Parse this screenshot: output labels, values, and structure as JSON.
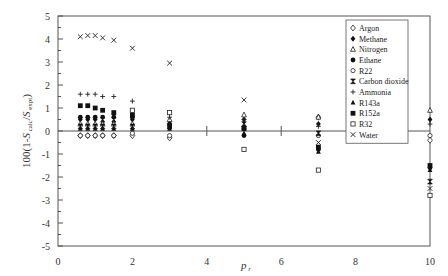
{
  "chart_data": {
    "type": "scatter",
    "title": "",
    "xlabel": "p r",
    "ylabel": "100(1-S calc/S expt)",
    "xlim": [
      0,
      10
    ],
    "ylim": [
      -5,
      5
    ],
    "xticks": [
      0,
      2,
      4,
      6,
      8,
      10
    ],
    "yticks": [
      -5,
      -4,
      -3,
      -2,
      -1,
      0,
      1,
      2,
      3,
      4,
      5
    ],
    "grid": false,
    "legend_position": "upper right (inside)",
    "series": [
      {
        "name": "Argon",
        "marker": "diamond-open",
        "points": [
          [
            0.6,
            -0.2
          ],
          [
            0.8,
            -0.2
          ],
          [
            1.0,
            -0.2
          ],
          [
            1.2,
            -0.2
          ],
          [
            1.5,
            -0.2
          ],
          [
            2.0,
            -0.2
          ],
          [
            3.0,
            -0.3
          ],
          [
            5.0,
            0.2
          ],
          [
            7.0,
            0.6
          ],
          [
            10.0,
            -0.4
          ]
        ]
      },
      {
        "name": "Methane",
        "marker": "diamond-filled",
        "points": [
          [
            0.6,
            0.5
          ],
          [
            0.8,
            0.5
          ],
          [
            1.0,
            0.5
          ],
          [
            1.2,
            0.4
          ],
          [
            1.5,
            0.4
          ],
          [
            2.0,
            0.5
          ],
          [
            3.0,
            0.3
          ],
          [
            5.0,
            0.5
          ],
          [
            7.0,
            0.3
          ],
          [
            10.0,
            0.5
          ]
        ]
      },
      {
        "name": "Nitrogen",
        "marker": "triangle-open",
        "points": [
          [
            0.6,
            0.3
          ],
          [
            0.8,
            0.3
          ],
          [
            1.0,
            0.3
          ],
          [
            1.2,
            0.3
          ],
          [
            1.5,
            0.3
          ],
          [
            2.0,
            0.3
          ],
          [
            3.0,
            0.5
          ],
          [
            5.0,
            0.7
          ],
          [
            7.0,
            0.6
          ],
          [
            10.0,
            0.9
          ]
        ]
      },
      {
        "name": "Ethane",
        "marker": "circle-filled",
        "points": [
          [
            0.6,
            0.6
          ],
          [
            0.8,
            0.6
          ],
          [
            1.0,
            0.6
          ],
          [
            1.2,
            0.6
          ],
          [
            1.5,
            0.6
          ],
          [
            2.0,
            0.6
          ],
          [
            3.0,
            0.3
          ],
          [
            5.0,
            -0.2
          ],
          [
            7.0,
            -0.8
          ],
          [
            10.0,
            -1.6
          ]
        ]
      },
      {
        "name": "R22",
        "marker": "circle-open",
        "points": [
          [
            0.6,
            -0.2
          ],
          [
            0.8,
            -0.2
          ],
          [
            1.0,
            -0.2
          ],
          [
            1.2,
            -0.2
          ],
          [
            1.5,
            -0.2
          ],
          [
            2.0,
            -0.1
          ],
          [
            3.0,
            -0.2
          ],
          [
            5.0,
            0.1
          ],
          [
            7.0,
            -0.2
          ],
          [
            10.0,
            -0.2
          ]
        ]
      },
      {
        "name": "Carbon dioxide",
        "marker": "hourglass",
        "points": [
          [
            0.6,
            0.2
          ],
          [
            0.8,
            0.2
          ],
          [
            1.0,
            0.2
          ],
          [
            1.2,
            0.2
          ],
          [
            1.5,
            0.2
          ],
          [
            2.0,
            0.2
          ],
          [
            3.0,
            0.2
          ],
          [
            5.0,
            0.3
          ],
          [
            7.0,
            -0.1
          ],
          [
            10.0,
            -2.2
          ]
        ]
      },
      {
        "name": "Ammonia",
        "marker": "plus",
        "points": [
          [
            0.6,
            1.6
          ],
          [
            0.8,
            1.6
          ],
          [
            1.0,
            1.6
          ],
          [
            1.2,
            1.5
          ],
          [
            1.5,
            1.5
          ],
          [
            2.0,
            1.3
          ],
          [
            3.0,
            0.6
          ],
          [
            5.0,
            0.5
          ],
          [
            7.0,
            0.2
          ],
          [
            10.0,
            0.3
          ]
        ]
      },
      {
        "name": "R143a",
        "marker": "triangle-filled",
        "points": [
          [
            0.6,
            0.1
          ],
          [
            0.8,
            0.1
          ],
          [
            1.0,
            0.1
          ],
          [
            1.2,
            0.1
          ],
          [
            1.5,
            0.1
          ],
          [
            2.0,
            0.1
          ],
          [
            3.0,
            0.1
          ],
          [
            5.0,
            -0.1
          ],
          [
            7.0,
            -0.9
          ],
          [
            10.0,
            -1.7
          ]
        ]
      },
      {
        "name": "R152a",
        "marker": "square-filled",
        "points": [
          [
            0.6,
            1.1
          ],
          [
            0.8,
            1.1
          ],
          [
            1.0,
            1.0
          ],
          [
            1.2,
            0.9
          ],
          [
            1.5,
            0.8
          ],
          [
            2.0,
            0.7
          ],
          [
            3.0,
            0.2
          ],
          [
            5.0,
            0.1
          ],
          [
            7.0,
            -0.7
          ],
          [
            10.0,
            -1.5
          ]
        ]
      },
      {
        "name": "R32",
        "marker": "square-open",
        "points": [
          [
            2.0,
            0.9
          ],
          [
            3.0,
            0.8
          ],
          [
            5.0,
            -0.8
          ],
          [
            7.0,
            -1.7
          ],
          [
            10.0,
            -2.8
          ]
        ]
      },
      {
        "name": "Water",
        "marker": "x",
        "points": [
          [
            0.6,
            4.1
          ],
          [
            0.8,
            4.15
          ],
          [
            1.0,
            4.15
          ],
          [
            1.2,
            4.05
          ],
          [
            1.5,
            3.95
          ],
          [
            2.0,
            3.6
          ],
          [
            3.0,
            2.95
          ],
          [
            5.0,
            1.35
          ],
          [
            7.0,
            -0.5
          ],
          [
            10.0,
            -2.5
          ]
        ]
      }
    ]
  },
  "axis": {
    "x_title_main": "p",
    "x_title_sub": "r",
    "y_title": "100(1-S calc/S expt)"
  }
}
